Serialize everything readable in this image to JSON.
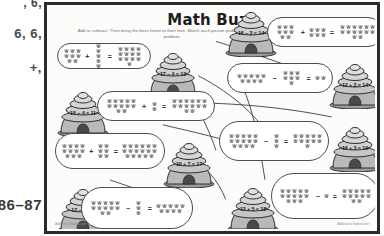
{
  "margin": {
    "line1": ", 6,",
    "line2": "6, 6,",
    "line3": "+,",
    "page_range": "86–87"
  },
  "worksheet": {
    "title": "Math Buzz",
    "instructions": "Add or subtract. Then bring the bees home to their hive. Match each picture problem to a number problem.",
    "footer_left": "Addition & Subtraction",
    "footer_right": "Addition & Subtraction"
  },
  "hives": [
    {
      "id": "hive-16-2",
      "label": "16 − 2 = 14",
      "left": 174,
      "top": 4
    },
    {
      "id": "hive-17-4",
      "label": "17 − 4 = 13",
      "left": 96,
      "top": 45
    },
    {
      "id": "hive-15-4",
      "label": "15 − 4 = 11",
      "left": 6,
      "top": 84
    },
    {
      "id": "hive-12-2",
      "label": "12 + 2 = 14",
      "left": 278,
      "top": 56
    },
    {
      "id": "hive-10-7",
      "label": "10 + 7 = 17",
      "left": 112,
      "top": 135
    },
    {
      "id": "hive-16-3",
      "label": "16 + 3 = 19",
      "left": 278,
      "top": 119
    },
    {
      "id": "hive-12-9",
      "label": "12 − 9 = 3",
      "left": 6,
      "top": 181
    },
    {
      "id": "hive-13-5",
      "label": "13 + 5 = 18",
      "left": 176,
      "top": 180
    }
  ],
  "problems": [
    {
      "id": "problem-top-right",
      "operator": "+",
      "a": 8,
      "b": 6,
      "result": 14,
      "left": 218,
      "top": 10,
      "width": 116,
      "height": 30
    },
    {
      "id": "problem-top-left",
      "operator": "+",
      "a": 8,
      "b": 5,
      "result": 13,
      "left": 8,
      "top": 36,
      "width": 94,
      "height": 26
    },
    {
      "id": "problem-mid-right",
      "operator": "−",
      "a": 9,
      "b": 7,
      "result": 2,
      "left": 178,
      "top": 56,
      "width": 106,
      "height": 30
    },
    {
      "id": "problem-mid-left",
      "operator": "+",
      "a": 12,
      "b": 2,
      "result": 14,
      "left": 48,
      "top": 84,
      "width": 118,
      "height": 30
    },
    {
      "id": "problem-center-left",
      "operator": "+",
      "a": 11,
      "b": 6,
      "result": 17,
      "left": 6,
      "top": 126,
      "width": 110,
      "height": 36
    },
    {
      "id": "problem-center-right",
      "operator": "−",
      "a": 14,
      "b": 3,
      "result": 11,
      "left": 170,
      "top": 114,
      "width": 110,
      "height": 40
    },
    {
      "id": "problem-bottom-left",
      "operator": "−",
      "a": 12,
      "b": 3,
      "result": 9,
      "left": 32,
      "top": 180,
      "width": 112,
      "height": 42
    },
    {
      "id": "problem-bottom-right",
      "operator": "−",
      "a": 13,
      "b": 1,
      "result": 12,
      "left": 222,
      "top": 166,
      "width": 108,
      "height": 46
    }
  ],
  "connectors": [
    "M 170 35 C 200 44 226 54 250 62",
    "M 152 70 C 190 90 210 110 232 140",
    "M 166 98 C 220 100 258 106 288 112",
    "M 116 120 C 150 128 178 134 198 142",
    "M 140 152 C 160 162 172 176 180 196",
    "M 62 176 C 90 186 110 192 132 198",
    "M 196 78 C 210 110 214 140 220 176",
    "M 110 62 C 140 80 158 110 170 146"
  ]
}
